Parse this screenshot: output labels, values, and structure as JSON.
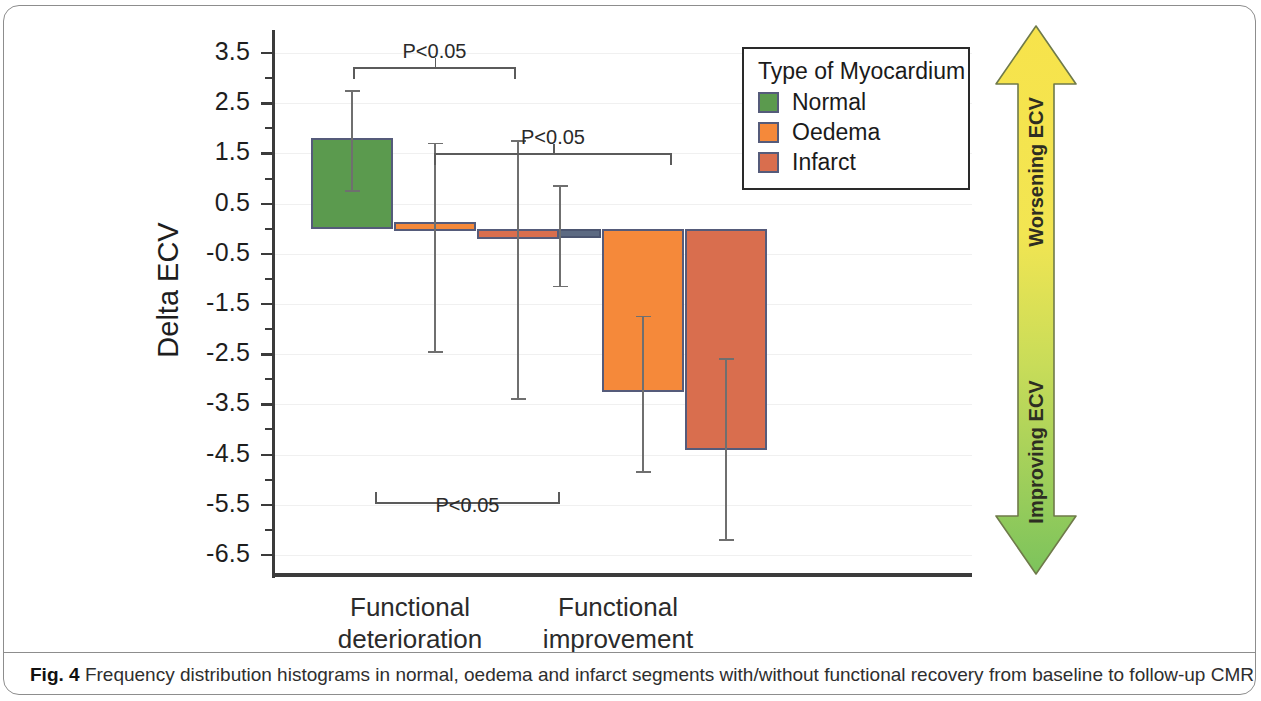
{
  "figure": {
    "caption_prefix": "Fig. 4",
    "caption_text": "Frequency distribution histograms in normal, oedema and infarct segments with/without functional recovery from baseline to follow-up CMR"
  },
  "legend": {
    "title": "Type of Myocardium",
    "entries": [
      {
        "label": "Normal",
        "color": "#5b9a4e"
      },
      {
        "label": "Oedema",
        "color": "#f5893a"
      },
      {
        "label": "Infarct",
        "color": "#d96e4e"
      }
    ]
  },
  "annotations": {
    "arrow_up_label": "Worsening ECV",
    "arrow_down_label": "Improving ECV",
    "arrow_color_top": "#f5e04a",
    "arrow_color_bottom": "#7dc45a",
    "significance": [
      {
        "label": "P<0.05",
        "comparison": "deterioration-normal vs deterioration-infarct"
      },
      {
        "label": "P<0.05",
        "comparison": "deterioration-infarct vs improvement-infarct"
      },
      {
        "label": "P<0.05",
        "comparison": "deterioration-infarct vs improvement-oedema"
      }
    ]
  },
  "chart_data": {
    "type": "bar",
    "title": "",
    "xlabel": "",
    "ylabel": "Delta ECV",
    "ylim": [
      -6.9,
      3.9
    ],
    "yticks": [
      3.5,
      2.5,
      1.5,
      0.5,
      -0.5,
      -1.5,
      -2.5,
      -3.5,
      -4.5,
      -5.5,
      -6.5
    ],
    "ytick_labels": [
      "3.5",
      "2.5",
      "1.5",
      "0.5",
      "-0.5",
      "-1.5",
      "-2.5",
      "-3.5",
      "-4.5",
      "-5.5",
      "-6.5"
    ],
    "minor_tick_step": 0.5,
    "grid": true,
    "grid_axis": "y",
    "legend_position": "top-right",
    "categories": [
      "Functional deterioration",
      "Functional improvement"
    ],
    "category_labels_multiline": [
      "Functional\ndeterioration",
      "Functional\nimprovement"
    ],
    "series": [
      {
        "name": "Normal",
        "color": "#5b9a4e",
        "values": [
          1.8,
          -0.1
        ],
        "error_low": [
          0.75,
          -1.15
        ],
        "error_high": [
          2.75,
          0.85
        ]
      },
      {
        "name": "Oedema",
        "color": "#f5893a",
        "values": [
          0.05,
          -3.25
        ],
        "error_low": [
          -2.45,
          -4.85
        ],
        "error_high": [
          1.7,
          -1.75
        ]
      },
      {
        "name": "Infarct",
        "color": "#d96e4e",
        "values": [
          -0.2,
          -4.4
        ],
        "error_low": [
          -3.4,
          -6.2
        ],
        "error_high": [
          1.75,
          -2.6
        ]
      }
    ]
  }
}
